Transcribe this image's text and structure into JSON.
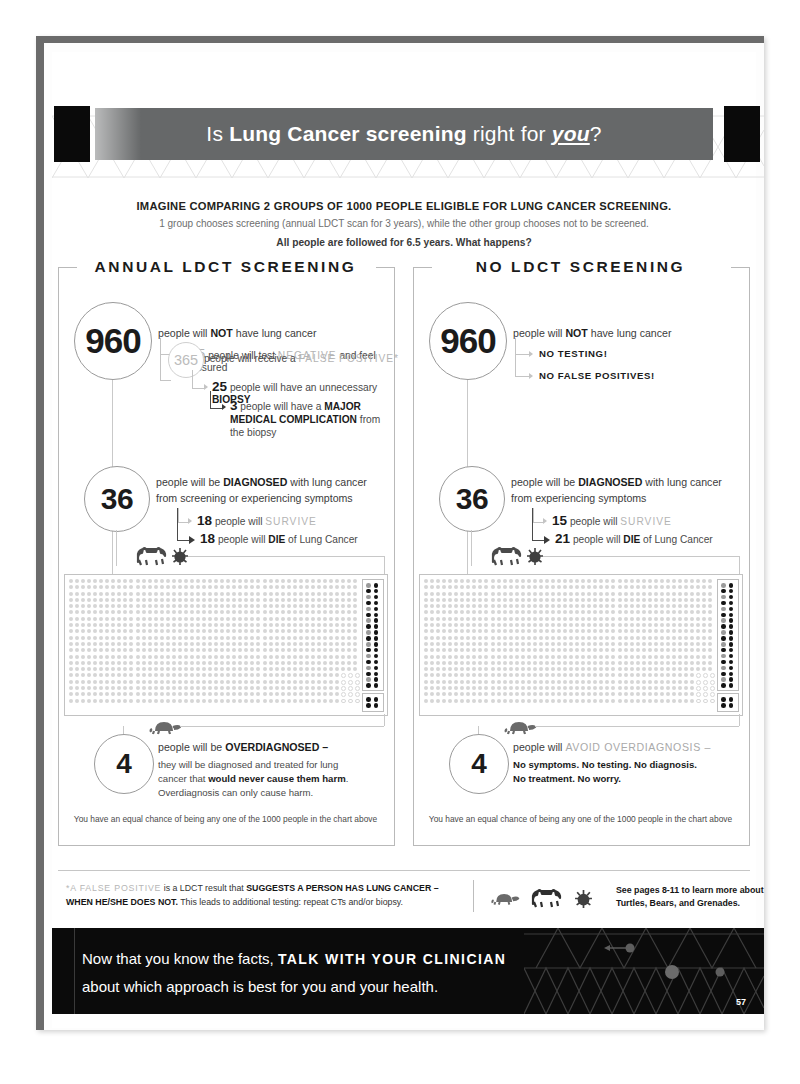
{
  "header": {
    "title_part1": "Is ",
    "title_bold": "Lung Cancer screening",
    "title_part2": " right for ",
    "title_italic": "you",
    "title_end": "?"
  },
  "intro": {
    "line1": "IMAGINE COMPARING 2 GROUPS OF 1000 PEOPLE ELIGIBLE FOR LUNG CANCER SCREENING.",
    "line2": "1 group chooses screening (annual LDCT scan for 3 years), while the other group chooses not to be screened.",
    "line3": "All people are followed for 6.5 years.  What happens?"
  },
  "left_panel": {
    "title": "ANNUAL LDCT SCREENING",
    "circle_960": "960",
    "lead_960_a": "people will ",
    "lead_960_b": "NOT",
    "lead_960_c": " have lung cancer",
    "item_595_num": "595",
    "item_595_a": "people will test ",
    "item_595_b": "NEGATIVE",
    "item_595_c": " and feel reassured",
    "item_365_num": "365",
    "item_365_a": "people will receive a ",
    "item_365_b": "FALSE POSITIVE*",
    "item_25_num": "25",
    "item_25_a": "people will have an unnecessary ",
    "item_25_b": "BIOPSY",
    "item_3_num": "3",
    "item_3_a": "people will have a ",
    "item_3_b": "MAJOR MEDICAL COMPLICATION",
    "item_3_c": " from the biopsy",
    "circle_36": "36",
    "lead_36_a": "people will be ",
    "lead_36_b": "DIAGNOSED",
    "lead_36_c": " with lung cancer",
    "lead_36_line2": "from screening or experiencing symptoms",
    "item_survive_num": "18",
    "item_survive_a": "people will ",
    "item_survive_b": "SURVIVE",
    "item_die_num": "18",
    "item_die_a": "people will ",
    "item_die_b": "DIE",
    "item_die_c": " of Lung Cancer",
    "circle_4": "4",
    "lead_4_a": "people will be ",
    "lead_4_b": "OVERDIAGNOSED –",
    "lead_4_sub1": "they will be diagnosed and treated for lung",
    "lead_4_sub2a": "cancer that ",
    "lead_4_sub2b": "would never cause them harm",
    "lead_4_sub2c": ".",
    "lead_4_sub3": "Overdiagnosis can only cause harm.",
    "footnote": "You have an equal chance of being any one of the 1000 people in the chart above"
  },
  "right_panel": {
    "title": "NO LDCT SCREENING",
    "circle_960": "960",
    "lead_960_a": "people will ",
    "lead_960_b": "NOT",
    "lead_960_c": " have lung cancer",
    "item_no_testing": "NO TESTING!",
    "item_no_false_positives": "NO FALSE POSITIVES!",
    "circle_36": "36",
    "lead_36_a": "people will be ",
    "lead_36_b": "DIAGNOSED",
    "lead_36_c": " with lung cancer",
    "lead_36_line2": "from experiencing symptoms",
    "item_survive_num": "15",
    "item_survive_a": "people will ",
    "item_survive_b": "SURVIVE",
    "item_die_num": "21",
    "item_die_a": "people will ",
    "item_die_b": "DIE",
    "item_die_c": " of Lung Cancer",
    "circle_4": "4",
    "lead_4_a": "people will ",
    "lead_4_b": "AVOID OVERDIAGNOSIS –",
    "lead_4_sub1": "No symptoms. No testing. No diagnosis.",
    "lead_4_sub2": "No treatment. No worry.",
    "footnote": "You have an equal chance of being any one of the 1000 people in the chart above"
  },
  "bottom_note": {
    "fp_label": "*A FALSE POSITIVE",
    "fp_text_a": " is a LDCT result that ",
    "fp_text_b": "SUGGESTS A PERSON HAS LUNG CANCER – WHEN HE/SHE DOES NOT.",
    "fp_text_c": " This leads to additional testing: repeat CTs and/or biopsy.",
    "see_pages_line1": "See pages 8-11 to learn more about",
    "see_pages_line2": "Turtles, Bears, and Grenades."
  },
  "footer": {
    "line1_a": "Now that you know the facts, ",
    "line1_b": "TALK WITH YOUR CLINICIAN",
    "line2": "about which approach is best for you and your health.",
    "page_number": "57"
  },
  "colors": {
    "title_band": "#666869",
    "footer_bg": "#0b0b0b",
    "ink": "#231f20",
    "muted": "#b4b4b4",
    "rule": "#c2c2c2"
  },
  "chart_data": {
    "type": "table",
    "title": "Is Lung Cancer screening right for you?",
    "cohort_size": 1000,
    "followup_years": 6.5,
    "groups": [
      {
        "name": "ANNUAL LDCT SCREENING",
        "no_lung_cancer": 960,
        "test_negative_reassured": 595,
        "false_positive": 365,
        "unnecessary_biopsy": 25,
        "major_medical_complication": 3,
        "diagnosed": 36,
        "survive": 18,
        "die": 18,
        "overdiagnosed": 4
      },
      {
        "name": "NO LDCT SCREENING",
        "no_lung_cancer": 960,
        "no_testing": true,
        "no_false_positives": true,
        "diagnosed": 36,
        "survive": 15,
        "die": 21,
        "avoid_overdiagnosis": 4
      }
    ],
    "icon_grid": {
      "total_dots": 1000,
      "light_dots": 960,
      "dark_dots_left": 40,
      "dark_dots_right": 40,
      "columns": 48,
      "rows": 20
    }
  }
}
